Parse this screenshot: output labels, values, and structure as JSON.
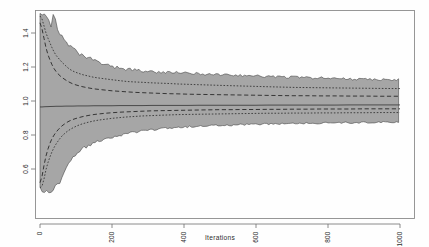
{
  "figure": {
    "background_color": "#fefefe",
    "frame_color": "#8c8c8c",
    "band_fill_color": "#a6a6a6",
    "line_color": "#2f2f2f"
  },
  "chart_data": {
    "type": "area",
    "title": "",
    "subtitle": "",
    "xlabel": "Iterations",
    "ylabel": "",
    "xlim": [
      0,
      1000
    ],
    "ylim": [
      0.48,
      1.52
    ],
    "grid": false,
    "legend": "none",
    "x_ticks": [
      0,
      200,
      400,
      600,
      800,
      1000
    ],
    "x_tick_labels": [
      "0",
      "200",
      "400",
      "600",
      "800",
      "1000"
    ],
    "y_ticks": [
      1.4,
      1.2,
      1.0,
      0.8,
      0.6
    ],
    "y_tick_labels": [
      "1.4",
      "1.2",
      "1.0",
      "0.8",
      "0.6"
    ],
    "y_tick_label_rotation": -90,
    "x_tick_label_rotation": -90,
    "x": [
      2,
      6,
      10,
      14,
      18,
      24,
      30,
      36,
      44,
      52,
      60,
      70,
      80,
      92,
      104,
      118,
      132,
      148,
      164,
      182,
      200,
      220,
      240,
      262,
      284,
      308,
      332,
      358,
      384,
      412,
      440,
      470,
      500,
      532,
      564,
      598,
      632,
      668,
      704,
      742,
      780,
      820,
      860,
      902,
      944,
      1000
    ],
    "series": [
      {
        "name": "envelope-max",
        "style": "solid-boundary",
        "values": [
          1.52,
          1.52,
          1.52,
          1.52,
          1.5,
          1.47,
          1.44,
          1.51,
          1.46,
          1.4,
          1.37,
          1.34,
          1.32,
          1.3,
          1.28,
          1.26,
          1.25,
          1.24,
          1.22,
          1.21,
          1.2,
          1.19,
          1.185,
          1.18,
          1.175,
          1.17,
          1.168,
          1.165,
          1.163,
          1.16,
          1.158,
          1.155,
          1.152,
          1.15,
          1.148,
          1.145,
          1.142,
          1.14,
          1.138,
          1.135,
          1.133,
          1.13,
          1.128,
          1.126,
          1.124,
          1.122
        ]
      },
      {
        "name": "quantile-97.5",
        "style": "dotted",
        "values": [
          1.5,
          1.48,
          1.45,
          1.42,
          1.39,
          1.36,
          1.33,
          1.3,
          1.27,
          1.25,
          1.23,
          1.21,
          1.19,
          1.175,
          1.165,
          1.155,
          1.148,
          1.14,
          1.135,
          1.13,
          1.125,
          1.12,
          1.115,
          1.112,
          1.11,
          1.107,
          1.105,
          1.103,
          1.1,
          1.098,
          1.096,
          1.094,
          1.092,
          1.09,
          1.088,
          1.086,
          1.084,
          1.082,
          1.08,
          1.079,
          1.078,
          1.077,
          1.076,
          1.075,
          1.074,
          1.073
        ]
      },
      {
        "name": "quantile-75",
        "style": "dashed",
        "values": [
          1.46,
          1.42,
          1.38,
          1.34,
          1.3,
          1.26,
          1.23,
          1.2,
          1.175,
          1.155,
          1.14,
          1.125,
          1.112,
          1.1,
          1.092,
          1.084,
          1.078,
          1.072,
          1.068,
          1.064,
          1.06,
          1.057,
          1.054,
          1.051,
          1.049,
          1.047,
          1.045,
          1.043,
          1.042,
          1.04,
          1.039,
          1.038,
          1.037,
          1.036,
          1.035,
          1.034,
          1.033,
          1.032,
          1.031,
          1.031,
          1.03,
          1.03,
          1.029,
          1.029,
          1.028,
          1.028
        ]
      },
      {
        "name": "median",
        "style": "solid",
        "values": [
          0.965,
          0.965,
          0.966,
          0.966,
          0.967,
          0.967,
          0.968,
          0.968,
          0.969,
          0.969,
          0.969,
          0.97,
          0.97,
          0.97,
          0.971,
          0.971,
          0.971,
          0.972,
          0.972,
          0.972,
          0.972,
          0.973,
          0.973,
          0.973,
          0.973,
          0.974,
          0.974,
          0.974,
          0.974,
          0.974,
          0.975,
          0.975,
          0.975,
          0.975,
          0.975,
          0.975,
          0.976,
          0.976,
          0.976,
          0.976,
          0.976,
          0.976,
          0.977,
          0.977,
          0.977,
          0.977
        ]
      },
      {
        "name": "quantile-25",
        "style": "dashed",
        "values": [
          0.52,
          0.56,
          0.61,
          0.65,
          0.69,
          0.73,
          0.765,
          0.79,
          0.815,
          0.835,
          0.852,
          0.868,
          0.881,
          0.892,
          0.9,
          0.908,
          0.914,
          0.92,
          0.924,
          0.928,
          0.931,
          0.934,
          0.936,
          0.938,
          0.94,
          0.942,
          0.943,
          0.944,
          0.945,
          0.946,
          0.947,
          0.948,
          0.949,
          0.949,
          0.95,
          0.95,
          0.951,
          0.951,
          0.952,
          0.952,
          0.953,
          0.953,
          0.953,
          0.954,
          0.954,
          0.954
        ]
      },
      {
        "name": "quantile-2.5",
        "style": "dotted",
        "values": [
          0.49,
          0.5,
          0.53,
          0.57,
          0.61,
          0.65,
          0.685,
          0.715,
          0.745,
          0.77,
          0.792,
          0.812,
          0.828,
          0.843,
          0.855,
          0.866,
          0.874,
          0.882,
          0.888,
          0.893,
          0.898,
          0.902,
          0.906,
          0.909,
          0.912,
          0.914,
          0.916,
          0.918,
          0.92,
          0.921,
          0.922,
          0.923,
          0.924,
          0.925,
          0.926,
          0.927,
          0.928,
          0.928,
          0.929,
          0.929,
          0.93,
          0.93,
          0.931,
          0.931,
          0.932,
          0.932
        ]
      },
      {
        "name": "envelope-min",
        "style": "solid-boundary",
        "values": [
          0.48,
          0.48,
          0.48,
          0.48,
          0.48,
          0.48,
          0.48,
          0.49,
          0.5,
          0.52,
          0.56,
          0.605,
          0.645,
          0.675,
          0.702,
          0.722,
          0.74,
          0.752,
          0.768,
          0.778,
          0.79,
          0.8,
          0.812,
          0.818,
          0.826,
          0.832,
          0.838,
          0.842,
          0.846,
          0.85,
          0.853,
          0.856,
          0.858,
          0.86,
          0.862,
          0.864,
          0.866,
          0.868,
          0.87,
          0.871,
          0.872,
          0.873,
          0.874,
          0.875,
          0.876,
          0.877
        ]
      }
    ]
  }
}
